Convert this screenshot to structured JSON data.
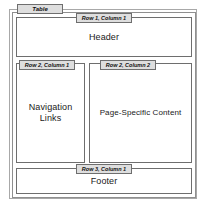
{
  "diagram": {
    "type": "html-table-page-layout",
    "container_tag": "Table",
    "cells": [
      {
        "id": "header",
        "tag": "Row 1, Column 1",
        "label": "Header"
      },
      {
        "id": "navigation",
        "tag": "Row 2, Column 1",
        "label": "Navigation\nLinks"
      },
      {
        "id": "content",
        "tag": "Row 2, Column 2",
        "label": "Page-Specific Content"
      },
      {
        "id": "footer",
        "tag": "Row 3, Column 1",
        "label": "Footer"
      }
    ],
    "colors": {
      "background": "#ffffff",
      "cell_border": "#6e6e6e",
      "outer_border": "#a8a8a8",
      "tag_fill": "#dedede",
      "text": "#1a1a1a"
    }
  }
}
